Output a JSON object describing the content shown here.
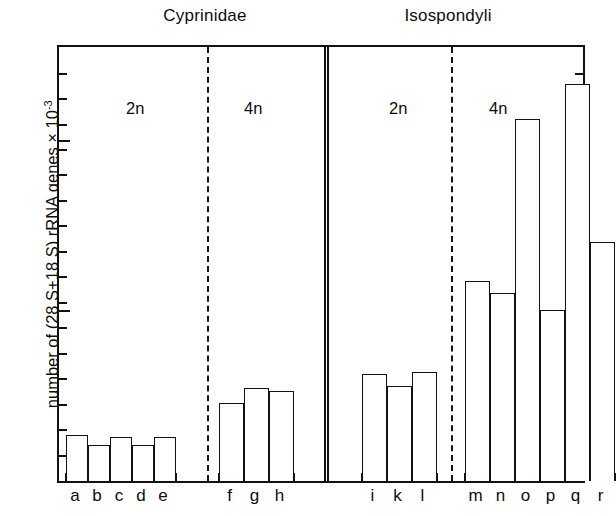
{
  "figure": {
    "y_axis_label": "number of (28 S+18 S) rRNA genes × 10",
    "y_axis_exponent": "-3",
    "groups": [
      {
        "name": "Cyprinidae"
      },
      {
        "name": "Isospondyli"
      }
    ],
    "ploidy_labels": [
      "2n",
      "4n",
      "2n",
      "4n"
    ]
  },
  "chart_data": {
    "type": "bar",
    "title": "",
    "subtitle": "",
    "xlabel": "",
    "ylabel": "number of (28 S+18 S) rRNA genes × 10^-3",
    "ylim": [
      0,
      2.58
    ],
    "ytick_labels": [
      "1",
      "2"
    ],
    "ytick_values": [
      1,
      2
    ],
    "minor_tick_step": 0.15,
    "grid": false,
    "legend": "none",
    "categories": [
      "a",
      "b",
      "c",
      "d",
      "e",
      "f",
      "g",
      "h",
      "i",
      "k",
      "l",
      "m",
      "n",
      "o",
      "p",
      "q",
      "r"
    ],
    "values": [
      0.27,
      0.21,
      0.26,
      0.21,
      0.26,
      0.46,
      0.55,
      0.53,
      0.63,
      0.56,
      0.64,
      1.18,
      1.11,
      2.13,
      1.01,
      2.34,
      1.41
    ],
    "annotations": [
      {
        "text": "Cyprinidae",
        "type": "group-heading",
        "covers": [
          "a",
          "b",
          "c",
          "d",
          "e",
          "f",
          "g",
          "h"
        ]
      },
      {
        "text": "Isospondyli",
        "type": "group-heading",
        "covers": [
          "i",
          "k",
          "l",
          "m",
          "n",
          "o",
          "p",
          "q",
          "r"
        ]
      },
      {
        "text": "2n",
        "type": "ploidy",
        "covers": [
          "a",
          "b",
          "c",
          "d",
          "e"
        ]
      },
      {
        "text": "4n",
        "type": "ploidy",
        "covers": [
          "f",
          "g",
          "h"
        ]
      },
      {
        "text": "2n",
        "type": "ploidy",
        "covers": [
          "i",
          "k",
          "l"
        ]
      },
      {
        "text": "4n",
        "type": "ploidy",
        "covers": [
          "m",
          "n",
          "o",
          "p",
          "q",
          "r"
        ]
      }
    ],
    "separators": [
      {
        "style": "dashed",
        "after": "e"
      },
      {
        "style": "double-solid",
        "after": "h"
      },
      {
        "style": "dashed",
        "after": "l"
      }
    ]
  }
}
